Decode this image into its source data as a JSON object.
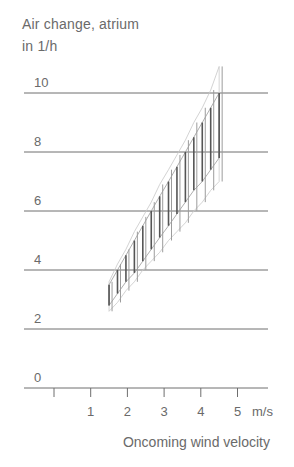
{
  "chart_data": {
    "type": "bar",
    "subtype": "range-band",
    "title": "",
    "ylabel_line1": "Air change, atrium",
    "ylabel_line2": "in 1/h",
    "xlabel": "Oncoming wind velocity",
    "x_unit": "m/s",
    "x_ticks": [
      0,
      1,
      2,
      3,
      4,
      5
    ],
    "x_tick_labels": [
      "",
      "1",
      "2",
      "3",
      "4",
      "5"
    ],
    "y_ticks": [
      0,
      2,
      4,
      6,
      8,
      10
    ],
    "y_tick_labels": [
      "0",
      "2",
      "4",
      "6",
      "8",
      "10"
    ],
    "xlim": [
      -0.8,
      5.9
    ],
    "ylim": [
      0,
      11
    ],
    "grid": "horizontal",
    "legend": null,
    "x": [
      1.5,
      1.73,
      1.96,
      2.19,
      2.42,
      2.65,
      2.88,
      3.12,
      3.35,
      3.58,
      3.81,
      4.04,
      4.27,
      4.5
    ],
    "series": [
      {
        "name": "inner range low",
        "values": [
          2.8,
          3.2,
          3.6,
          3.9,
          4.3,
          4.7,
          5.1,
          5.5,
          5.9,
          6.3,
          6.7,
          7.0,
          7.4,
          7.8
        ]
      },
      {
        "name": "inner range high",
        "values": [
          3.5,
          4.0,
          4.5,
          5.0,
          5.5,
          6.0,
          6.5,
          7.0,
          7.5,
          8.0,
          8.5,
          9.0,
          9.5,
          10.0
        ]
      },
      {
        "name": "outer range low",
        "values": [
          2.6,
          2.9,
          3.3,
          3.6,
          4.0,
          4.3,
          4.6,
          5.0,
          5.3,
          5.6,
          6.0,
          6.3,
          6.7,
          7.0
        ]
      },
      {
        "name": "outer range high",
        "values": [
          3.6,
          4.2,
          4.7,
          5.3,
          5.8,
          6.3,
          6.9,
          7.4,
          7.9,
          8.4,
          9.0,
          9.5,
          10.1,
          10.9
        ]
      }
    ]
  }
}
